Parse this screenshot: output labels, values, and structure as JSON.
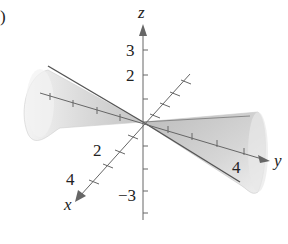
{
  "figure": {
    "part_label": ")",
    "axes": {
      "x_label": "x",
      "y_label": "y",
      "z_label": "z"
    },
    "tick_labels": {
      "z_pos_3": "3",
      "z_pos_2": "2",
      "z_neg_3": "−3",
      "x_2": "2",
      "x_4": "4",
      "y_4": "4"
    },
    "surface": "double cone opening along the y-axis",
    "colors": {
      "surface_light": "#ececec",
      "surface_dark": "#b4b4b4",
      "axis": "#555555",
      "text": "#222222"
    }
  }
}
